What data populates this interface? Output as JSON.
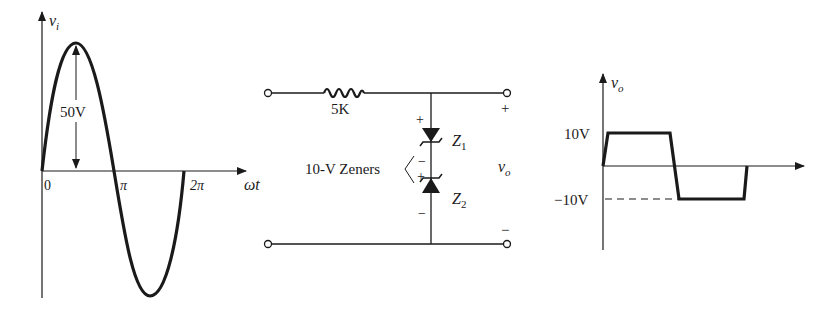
{
  "input_waveform": {
    "y_axis_label": "v",
    "y_axis_subscript": "i",
    "x_axis_label": "ωt",
    "tick_labels": [
      "0",
      "π",
      "2π"
    ],
    "amplitude_label": "50V"
  },
  "circuit": {
    "resistor_label": "5K",
    "zener_group_label": "10-V Zeners",
    "zener1_label": "Z",
    "zener1_subscript": "1",
    "zener2_label": "Z",
    "zener2_subscript": "2",
    "zener1_top_polarity": "+",
    "zener1_bottom_polarity": "−",
    "zener2_top_polarity": "+",
    "zener2_bottom_polarity": "−",
    "output_label": "v",
    "output_subscript": "o",
    "output_plus": "+",
    "output_minus": "−"
  },
  "output_waveform": {
    "y_axis_label": "v",
    "y_axis_subscript": "o",
    "high_level_label": "10V",
    "low_level_label": "−10V"
  },
  "colors": {
    "ink": "#1a1a1a",
    "background": "#ffffff"
  }
}
